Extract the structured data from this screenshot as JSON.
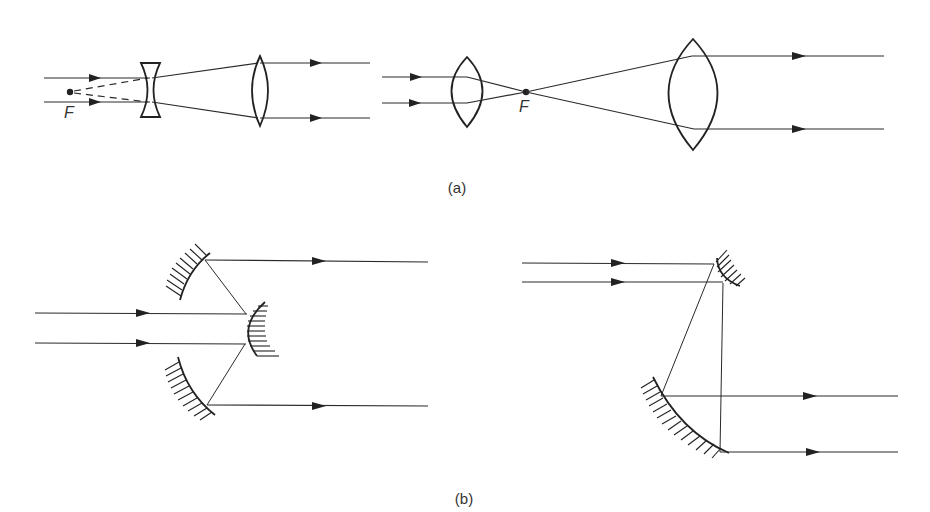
{
  "figure": {
    "part_a": {
      "caption": "(a)",
      "left_system": {
        "description": "Galilean beam expander: diverging lens then converging lens",
        "focal_point_label": "F"
      },
      "right_system": {
        "description": "Keplerian beam expander: two converging lenses with common focus",
        "focal_point_label": "F"
      }
    },
    "part_b": {
      "caption": "(b)",
      "left_system": {
        "description": "Cassegrain-type reflective beam expander with convex secondary mirror"
      },
      "right_system": {
        "description": "Off-axis reflective beam expander with two concave mirrors"
      }
    },
    "colors": {
      "line": "#222222",
      "background": "#ffffff"
    }
  }
}
